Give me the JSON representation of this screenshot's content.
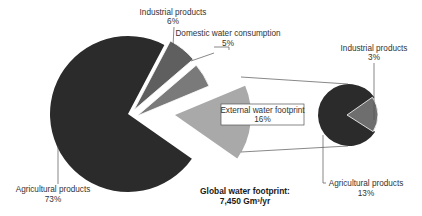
{
  "chart_data": {
    "type": "pie",
    "title_lines": [
      "Global water footprint:",
      "7,450 Gm³/yr"
    ],
    "subtype": "pie-of-pie",
    "main_pie": {
      "slices": [
        {
          "label": "Agricultural products",
          "value": 73,
          "display": "73%",
          "color": "#2b2b2b"
        },
        {
          "label": "Industrial products",
          "value": 6,
          "display": "6%",
          "color": "#5f5f5f",
          "exploded": true
        },
        {
          "label": "Domestic water consumption",
          "value": 5,
          "display": "5%",
          "color": "#7a7a7a",
          "exploded": true
        },
        {
          "label": "External water footprint",
          "value": 16,
          "display": "16%",
          "color": "#a9a9a9",
          "exploded": true,
          "boxed_label": true
        }
      ]
    },
    "breakdown_pie": {
      "parent": "External water footprint",
      "slices": [
        {
          "label": "Agricultural products",
          "value": 13,
          "display": "13%",
          "color": "#2b2b2b"
        },
        {
          "label": "Industrial products",
          "value": 3,
          "display": "3%",
          "color": "#6e6e6e"
        }
      ]
    },
    "legend": "none (leader-line labels)"
  },
  "labels": {
    "main_agri": {
      "name": "Agricultural products",
      "pct": "73%"
    },
    "main_ind": {
      "name": "Industrial products",
      "pct": "6%"
    },
    "main_dom": {
      "name": "Domestic water consumption",
      "pct": "5%"
    },
    "ext": {
      "name": "External water footprint",
      "pct": "16%"
    },
    "small_ind": {
      "name": "Industrial products",
      "pct": "3%"
    },
    "small_agri": {
      "name": "Agricultural products",
      "pct": "13%"
    },
    "title1": "Global water footprint:",
    "title2": "7,450 Gm³/yr"
  }
}
